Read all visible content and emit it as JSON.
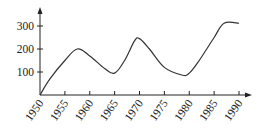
{
  "chart_data": {
    "type": "line",
    "title": "",
    "xlabel": "",
    "ylabel": "",
    "xlim": [
      1950,
      1990
    ],
    "ylim": [
      0,
      340
    ],
    "grid": false,
    "legend": null,
    "x_ticks": [
      "1950",
      "1955",
      "1960",
      "1965",
      "1970",
      "1975",
      "1980",
      "1985",
      "1990"
    ],
    "y_ticks": [
      "100",
      "200",
      "300"
    ],
    "series": [
      {
        "name": "curve",
        "x": [
          1950,
          1952,
          1955,
          1957.5,
          1960,
          1963,
          1965,
          1967,
          1969,
          1970,
          1972,
          1975,
          1978.5,
          1980,
          1982,
          1985,
          1987,
          1990
        ],
        "values": [
          0,
          70,
          150,
          200,
          170,
          115,
          95,
          150,
          235,
          245,
          200,
          120,
          87,
          95,
          150,
          250,
          312,
          312
        ]
      }
    ],
    "colors": {
      "line": "#333333",
      "axis": "#222222"
    }
  }
}
